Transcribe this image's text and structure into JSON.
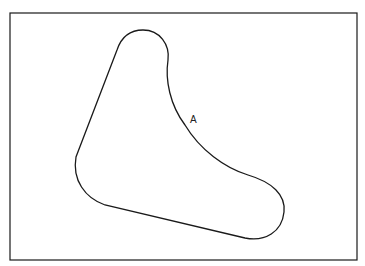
{
  "diagram": {
    "region_label": "A",
    "stroke_color": "#1a1a1a",
    "background": "#ffffff"
  }
}
